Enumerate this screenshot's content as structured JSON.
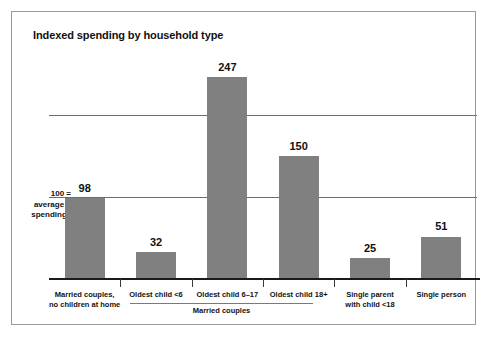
{
  "chart_data": {
    "type": "bar",
    "title": "Indexed spending by household type",
    "xlabel": "",
    "ylabel": "",
    "categories": [
      "Married couples,\nno children at home",
      "Oldest child <6",
      "Oldest child 6–17",
      "Oldest child 18+",
      "Single parent\nwith child <18",
      "Single person"
    ],
    "values": [
      98,
      32,
      247,
      150,
      25,
      51
    ],
    "ylim": [
      0,
      290
    ],
    "grid": true,
    "gridlines": [
      100,
      200
    ],
    "legend": "none",
    "reference_note": "100 = average spending",
    "group_annotation": "Married couples",
    "bar_color": "#808080",
    "background_color": "#ffffff"
  },
  "chart": {
    "title": "Indexed spending by household type",
    "reference_label": {
      "line1": "100 =",
      "line2": "average",
      "line3": "spending"
    },
    "group_label": "Married couples",
    "bars": [
      {
        "value_label": "98",
        "category_line1": "Married couples,",
        "category_line2": "no children at home"
      },
      {
        "value_label": "32",
        "category_line1": "Oldest child <6",
        "category_line2": ""
      },
      {
        "value_label": "247",
        "category_line1": "Oldest child 6–17",
        "category_line2": ""
      },
      {
        "value_label": "150",
        "category_line1": "Oldest child 18+",
        "category_line2": ""
      },
      {
        "value_label": "25",
        "category_line1": "Single parent",
        "category_line2": "with child <18"
      },
      {
        "value_label": "51",
        "category_line1": "Single person",
        "category_line2": ""
      }
    ]
  }
}
